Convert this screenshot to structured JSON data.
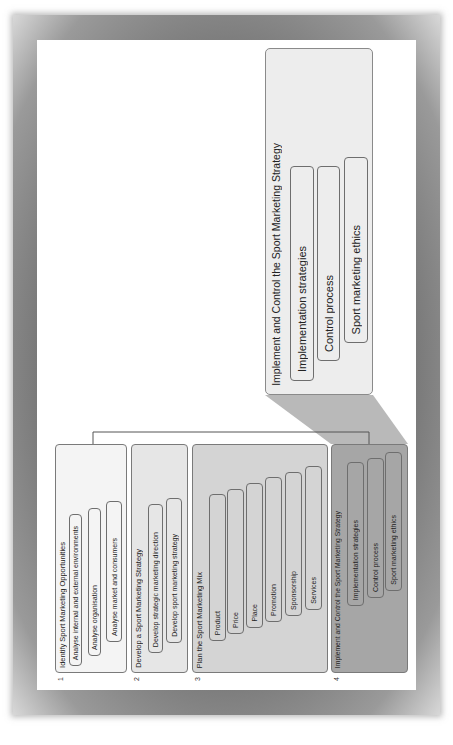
{
  "diagram": {
    "orientation": "rotated-90-ccw",
    "colors": {
      "stage1_fill": "#f4f4f4",
      "stage2_fill": "#e6e6e6",
      "stage3_fill": "#d4d4d4",
      "stage4_fill": "#a6a6a6",
      "callout_fill": "#ededed",
      "wedge_fill": "#b9b9b9",
      "frame": "#7a7a7a"
    },
    "stages": [
      {
        "number": "1",
        "title": "Identify Sport Marketing Opportunities",
        "items": [
          "Analyse internal and external environments",
          "Analyse organisation",
          "Analyse market and consumers"
        ]
      },
      {
        "number": "2",
        "title": "Develop a Sport Marketing Strategy",
        "items": [
          "Develop strategic marketing direction",
          "Develop sport marketing strategy"
        ]
      },
      {
        "number": "3",
        "title": "Plan the Sport Marketing Mix",
        "items": [
          "Product",
          "Price",
          "Place",
          "Promotion",
          "Sponsorship",
          "Services"
        ]
      },
      {
        "number": "4",
        "title": "Implement and Control the Sport Marketing Strategy",
        "items": [
          "Implementation strategies",
          "Control process",
          "Sport marketing ethics"
        ]
      }
    ],
    "callout": {
      "title": "Implement and Control the Sport Marketing Strategy",
      "items": [
        "Implementation strategies",
        "Control process",
        "Sport marketing ethics"
      ]
    }
  }
}
